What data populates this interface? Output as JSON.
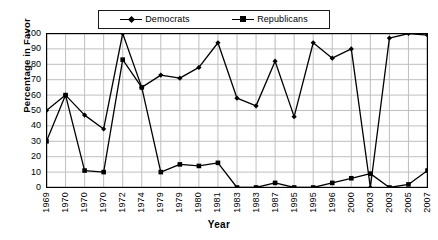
{
  "chart_data": {
    "type": "line",
    "title": "",
    "xlabel": "Year",
    "ylabel": "Percentage in Favor",
    "ylim": [
      0,
      100
    ],
    "ytick_step": 10,
    "yticks": [
      100,
      90,
      80,
      70,
      60,
      50,
      40,
      30,
      20,
      10,
      0
    ],
    "grid": true,
    "legend_position": "top-center",
    "categories": [
      "1969",
      "1970",
      "1970",
      "1970",
      "1972",
      "1974",
      "1979",
      "1979",
      "1980",
      "1981",
      "1983",
      "1983",
      "1987",
      "1995",
      "1995",
      "1996",
      "2000",
      "2003",
      "2003",
      "2005",
      "2007"
    ],
    "series": [
      {
        "name": "Democrats",
        "marker": "diamond",
        "color": "#000000",
        "values": [
          50,
          60,
          47,
          38,
          100,
          65,
          73,
          71,
          78,
          94,
          58,
          53,
          82,
          46,
          94,
          84,
          90,
          0,
          97,
          100,
          99
        ]
      },
      {
        "name": "Republicans",
        "marker": "square",
        "color": "#000000",
        "values": [
          30,
          60,
          11,
          10,
          83,
          65,
          10,
          15,
          14,
          16,
          0,
          0,
          3,
          0,
          0,
          3,
          6,
          9,
          0,
          2,
          11
        ]
      }
    ]
  },
  "colors": {
    "axis": "#000000",
    "grid": "#bfbfbf",
    "background": "#ffffff",
    "series": "#000000"
  }
}
